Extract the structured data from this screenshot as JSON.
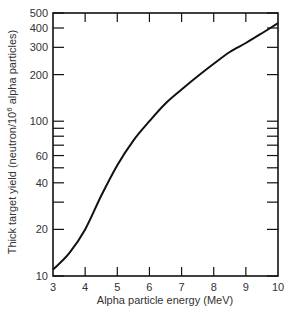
{
  "chart_data": {
    "type": "line",
    "title": "",
    "xlabel": "Alpha particle energy (MeV)",
    "ylabel": "Thick target yield (neutron/10^6 alpha particles)",
    "ylabel_main": "Thick target yield (neutron/10",
    "ylabel_sup": "6",
    "ylabel_end": " alpha particles)",
    "xlim": [
      3,
      10
    ],
    "ylim": [
      10,
      500
    ],
    "yscale": "log",
    "grid": false,
    "x_ticks": [
      3,
      4,
      5,
      6,
      7,
      8,
      9,
      10
    ],
    "y_tick_labels": [
      10,
      20,
      40,
      60,
      100,
      200,
      300,
      400,
      500
    ],
    "y_minor_ticks": [
      30,
      50,
      70,
      80,
      90
    ],
    "series": [
      {
        "name": "Thick target yield",
        "x": [
          3.0,
          3.5,
          4.0,
          4.5,
          5.0,
          5.5,
          6.0,
          6.5,
          7.0,
          7.5,
          8.0,
          8.5,
          9.0,
          9.5,
          10.0
        ],
        "values": [
          11,
          14,
          20,
          33,
          52,
          75,
          100,
          130,
          160,
          195,
          235,
          280,
          320,
          370,
          430
        ]
      }
    ]
  }
}
